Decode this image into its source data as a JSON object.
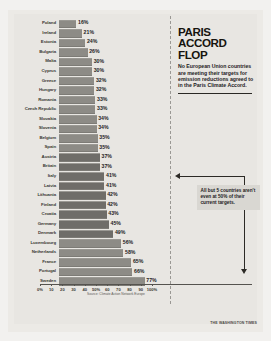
{
  "headline": {
    "title_line1": "PARIS",
    "title_line2": "ACCORD",
    "title_line3": "FLOP",
    "deck": "No European Union countries are meeting their targets for emission reductions agreed to in the Paris Climate Accord."
  },
  "annotation": {
    "text": "All but 5 countries aren't even at 50% of their current targets."
  },
  "credit": "THE WASHINGTON TIMES",
  "chart_data": {
    "type": "bar",
    "orientation": "horizontal",
    "title": "PARIS ACCORD FLOP",
    "xlabel": "",
    "ylabel": "",
    "xlim": [
      0,
      100
    ],
    "grid": false,
    "legend": null,
    "source": "Source: Climate Action Network Europe",
    "tick_labels": [
      "0%",
      "10",
      "20",
      "30",
      "40",
      "50%",
      "60",
      "70",
      "80",
      "90",
      "100%"
    ],
    "tick_values": [
      0,
      10,
      20,
      30,
      40,
      50,
      60,
      70,
      80,
      90,
      100
    ],
    "value_suffix": "%",
    "categories": [
      "Poland",
      "Ireland",
      "Estonia",
      "Bulgaria",
      "Malta",
      "Cyprus",
      "Greece",
      "Hungary",
      "Romania",
      "Czech Republic",
      "Slovakia",
      "Slovenia",
      "Belgium",
      "Spain",
      "Austria",
      "Britain",
      "Italy",
      "Latvia",
      "Lithuania",
      "Finland",
      "Croatia",
      "Germany",
      "Denmark",
      "Luxembourg",
      "Netherlands",
      "France",
      "Portugal",
      "Sweden"
    ],
    "values": [
      16,
      21,
      24,
      26,
      30,
      30,
      32,
      32,
      33,
      33,
      34,
      34,
      35,
      35,
      37,
      37,
      41,
      41,
      42,
      42,
      43,
      45,
      49,
      56,
      58,
      65,
      66,
      77
    ],
    "value_labels": [
      "16%",
      "21%",
      "24%",
      "26%",
      "30%",
      "30%",
      "32%",
      "32%",
      "33%",
      "33%",
      "34%",
      "34%",
      "35%",
      "35%",
      "37%",
      "37%",
      "41%",
      "41%",
      "42%",
      "42%",
      "43%",
      "45%",
      "49%",
      "56%",
      "58%",
      "65%",
      "66%",
      "77%"
    ],
    "colors": {
      "bar": "#8d8b86",
      "text": "#23211d",
      "background": "#e8e6e2"
    }
  }
}
